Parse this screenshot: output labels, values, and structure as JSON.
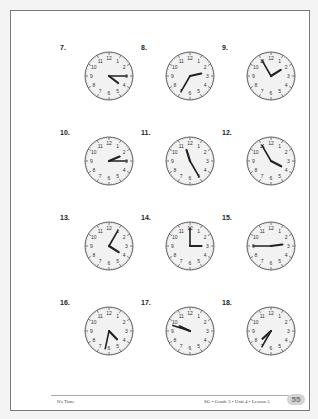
{
  "worksheet": {
    "clocks": [
      {
        "number": "7.",
        "hour": 4,
        "minute": 15
      },
      {
        "number": "8.",
        "hour": 2,
        "minute": 35
      },
      {
        "number": "9.",
        "hour": 1,
        "minute": 55
      },
      {
        "number": "10.",
        "hour": 2,
        "minute": 15
      },
      {
        "number": "11.",
        "hour": 11,
        "minute": 25
      },
      {
        "number": "12.",
        "hour": 3,
        "minute": 55
      },
      {
        "number": "13.",
        "hour": 4,
        "minute": 5
      },
      {
        "number": "14.",
        "hour": 3,
        "minute": 0
      },
      {
        "number": "15.",
        "hour": 2,
        "minute": 45
      },
      {
        "number": "16.",
        "hour": 4,
        "minute": 32
      },
      {
        "number": "17.",
        "hour": 9,
        "minute": 48
      },
      {
        "number": "18.",
        "hour": 7,
        "minute": 35
      }
    ],
    "dial_numbers": [
      "12",
      "1",
      "2",
      "3",
      "4",
      "5",
      "6",
      "7",
      "8",
      "9",
      "10",
      "11"
    ]
  },
  "footer": {
    "left": "It's Time",
    "right": "SG • Grade 3 • Unit 4 • Lesson 5",
    "page_number": "55"
  }
}
